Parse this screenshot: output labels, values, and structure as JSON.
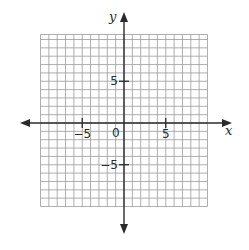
{
  "chart_data": {
    "type": "scatter",
    "title": "",
    "xlabel": "x",
    "ylabel": "y",
    "xlim": [
      -10,
      10
    ],
    "ylim": [
      -10,
      10
    ],
    "grid": true,
    "grid_step": 1,
    "x_ticks": [
      {
        "value": -5,
        "label": "−5"
      },
      {
        "value": 5,
        "label": "5"
      }
    ],
    "y_ticks": [
      {
        "value": 5,
        "label": "5"
      },
      {
        "value": -5,
        "label": "−5"
      }
    ],
    "origin_label": "0",
    "points": [],
    "legend": null
  },
  "colors": {
    "grid": "#9a9a9a",
    "axis": "#2b2b2b",
    "background": "#ffffff"
  }
}
